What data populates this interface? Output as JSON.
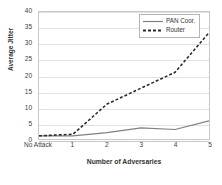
{
  "chart_data": {
    "type": "line",
    "title": "",
    "xlabel": "Number of Adversaries",
    "ylabel": "Average Jitter",
    "categories": [
      "No Attack",
      "1",
      "2",
      "3",
      "4",
      "5"
    ],
    "series": [
      {
        "name": "PAN Coor.",
        "values": [
          1,
          1,
          2,
          3.5,
          3,
          5.7
        ],
        "style": "solid",
        "color": "#808080"
      },
      {
        "name": "Router",
        "values": [
          1,
          1.5,
          11,
          16,
          21,
          33.5
        ],
        "style": "dashed",
        "color": "#2b2b2b"
      }
    ],
    "ylim": [
      0,
      40
    ],
    "yticks": [
      0,
      5,
      10,
      15,
      20,
      25,
      30,
      35,
      40
    ],
    "ytick_labels": [
      "0",
      "5",
      "10",
      "15",
      "20",
      "25",
      "30",
      "35",
      "40"
    ],
    "grid": "horizontal",
    "legend_position": "top-right"
  },
  "legend": {
    "entries": [
      {
        "label": "PAN Coor."
      },
      {
        "label": "Router"
      }
    ]
  },
  "colors": {
    "pan_coor": "#808080",
    "router": "#2b2b2b",
    "gridline": "#e2e2e2",
    "border": "#c8c8c8",
    "background": "#ffffff"
  }
}
